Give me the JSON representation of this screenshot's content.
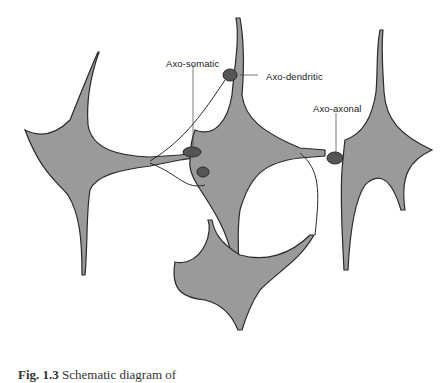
{
  "figure": {
    "labels": {
      "axo_somatic": "Axo-somatic",
      "axo_dendritic": "Axo-dendritic",
      "axo_axonal": "Axo-axonal"
    },
    "caption": {
      "number": "Fig. 1.3",
      "text": "Schematic diagram of"
    },
    "colors": {
      "soma_fill": "#9a9a9a",
      "terminal_fill": "#555555",
      "outline": "#2a2a2a",
      "background": "#ffffff"
    }
  }
}
